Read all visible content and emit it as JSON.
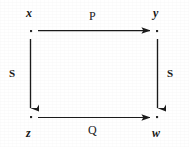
{
  "figure": {
    "type": "commutative-square-diagram",
    "background_color": "#ffffff",
    "ink_color": "#161616",
    "width": 189,
    "height": 147
  },
  "nodes": [
    {
      "id": "x",
      "label": "x",
      "position": "top-left",
      "dot_x": 31,
      "dot_y": 31
    },
    {
      "id": "y",
      "label": "y",
      "position": "top-right",
      "dot_x": 157,
      "dot_y": 31
    },
    {
      "id": "z",
      "label": "z",
      "position": "bottom-left",
      "dot_x": 31,
      "dot_y": 117
    },
    {
      "id": "w",
      "label": "w",
      "position": "bottom-right",
      "dot_x": 157,
      "dot_y": 117
    }
  ],
  "edges": [
    {
      "id": "top",
      "label": "P",
      "from": "x",
      "to": "y",
      "orientation": "horizontal",
      "direction": "right",
      "x1": 38,
      "y1": 30,
      "x2": 152,
      "y2": 30
    },
    {
      "id": "bottom",
      "label": "Q",
      "from": "z",
      "to": "w",
      "orientation": "horizontal",
      "direction": "right",
      "x1": 38,
      "y1": 117,
      "x2": 152,
      "y2": 117
    },
    {
      "id": "left",
      "label": "S",
      "from": "x",
      "to": "z",
      "orientation": "vertical",
      "direction": "down",
      "x1": 30,
      "y1": 39,
      "x2": 30,
      "y2": 110
    },
    {
      "id": "right",
      "label": "S",
      "from": "y",
      "to": "w",
      "orientation": "vertical",
      "direction": "down",
      "x1": 157,
      "y1": 39,
      "x2": 157,
      "y2": 110
    }
  ],
  "labels": {
    "node_x": "x",
    "node_y": "y",
    "node_z": "z",
    "node_w": "w",
    "edge_top": "P",
    "edge_bottom": "Q",
    "edge_left": "S",
    "edge_right": "S"
  }
}
